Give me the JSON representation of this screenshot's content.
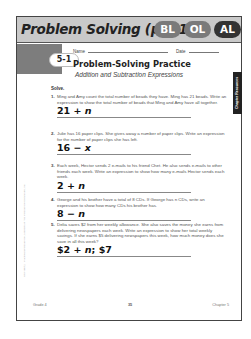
{
  "header": {
    "title": "Problem Solving (p. 11)",
    "badges": [
      "BL",
      "OL",
      "AL"
    ]
  },
  "worksheet": {
    "lesson_number": "5-1",
    "name_label": "Name",
    "date_label": "Date",
    "title": "Problem-Solving Practice",
    "subtitle": "Addition and Subtraction Expressions",
    "side_tab": "Chapter Resources",
    "solve_label": "Solve.",
    "copyright": "Copyright © Macmillan/McGraw-Hill, a division of The McGraw-Hill Companies, Inc.",
    "problems": [
      {
        "num": "1.",
        "text": "Ming and Amy count the total number of beads they have. Ming has 21 beads. Write an expression to show the total number of beads that Ming and Amy have all together.",
        "answer_prefix": "21 + ",
        "answer_var": "n",
        "answer_suffix": ""
      },
      {
        "num": "2.",
        "text": "Julie has 16 paper clips. She gives away a number of paper clips. Write an expression for the number of paper clips she has left.",
        "answer_prefix": "16 − ",
        "answer_var": "x",
        "answer_suffix": ""
      },
      {
        "num": "3.",
        "text": "Each week, Hector sends 2 e-mails to his friend Chet. He also sends e-mails to other friends each week. Write an expression to show how many e-mails Hector sends each week.",
        "answer_prefix": "2 + ",
        "answer_var": "n",
        "answer_suffix": ""
      },
      {
        "num": "4.",
        "text": "George and his brother have a total of 8 CDs. If George has n CDs, write an expression to show how many CDs his brother has.",
        "answer_prefix": "8 − ",
        "answer_var": "n",
        "answer_suffix": ""
      },
      {
        "num": "5.",
        "text": "Delia saves $2 from her weekly allowance. She also saves the money she earns from delivering newspapers each week. Write an expression to show her total weekly savings. If she earns $5 delivering newspapers this week, how much money does she save in all this week?",
        "answer_prefix": "$2 + ",
        "answer_var": "n",
        "answer_suffix": "; $7"
      }
    ],
    "footer": {
      "left": "Grade 4",
      "page": "35",
      "right": "Chapter 5"
    }
  }
}
